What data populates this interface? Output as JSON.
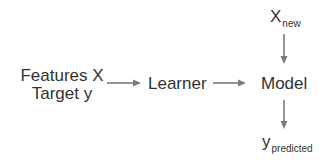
{
  "diagram": {
    "type": "flow",
    "inputs": {
      "line1": "Features X",
      "line2": "Target y"
    },
    "learner": {
      "label": "Learner"
    },
    "model": {
      "label": "Model"
    },
    "new_input": {
      "base": "X",
      "subscript": "new"
    },
    "output": {
      "base": "y",
      "subscript": "predicted"
    },
    "edges": [
      {
        "from": "inputs",
        "to": "learner"
      },
      {
        "from": "learner",
        "to": "model"
      },
      {
        "from": "new_input",
        "to": "model"
      },
      {
        "from": "model",
        "to": "output"
      }
    ],
    "colors": {
      "text": "#333333",
      "arrow": "#7a7a7a"
    }
  }
}
